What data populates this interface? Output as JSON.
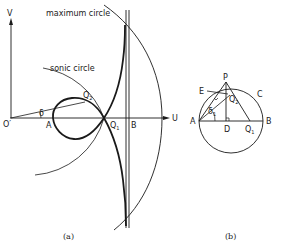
{
  "figure_a": {
    "caption": "(a)",
    "axis_v": "V",
    "axis_u": "U",
    "labels": {
      "origin": "O′",
      "a": "A",
      "q1": "Q",
      "q1_sub": "1",
      "q2": "Q",
      "q2_sub": "2",
      "b": "B",
      "angle": "δ",
      "sonic": "sonic circle",
      "maximum": "maximum circle"
    }
  },
  "figure_b": {
    "caption": "(b)",
    "labels": {
      "a": "A",
      "b": "B",
      "c": "C",
      "d": "D",
      "e": "E",
      "p": "P",
      "q1": "Q",
      "q1_sub": "1",
      "q2": "Q",
      "q2_sub": "2",
      "angle": "δ",
      "angle_sub": "1"
    }
  }
}
